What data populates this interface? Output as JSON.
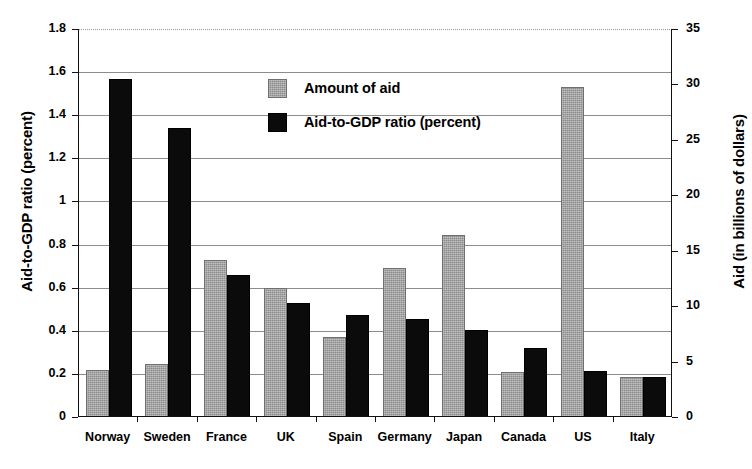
{
  "chart_data": {
    "type": "bar",
    "title": "",
    "subtitle": "",
    "xlabel": "",
    "ylabel": "Aid-to-GDP ratio (percent)",
    "ylabel_right": "Aid (in billions of dollars)",
    "categories": [
      "Norway",
      "Sweden",
      "France",
      "UK",
      "Spain",
      "Germany",
      "Japan",
      "Canada",
      "US",
      "Italy"
    ],
    "series": [
      {
        "name": "Amount of aid",
        "axis": "right",
        "unit": "billions of dollars",
        "color": "#8a8a8a",
        "values": [
          4.1,
          4.6,
          14.0,
          11.5,
          7.0,
          13.2,
          16.2,
          3.9,
          29.6,
          3.4
        ],
        "values_left_axis_equivalent": [
          0.21,
          0.235,
          0.72,
          0.59,
          0.36,
          0.68,
          0.835,
          0.2,
          1.52,
          0.175
        ]
      },
      {
        "name": "Aid-to-GDP ratio (percent)",
        "axis": "left",
        "unit": "percent",
        "color": "#0b0b0b",
        "values": [
          1.56,
          1.33,
          0.65,
          0.52,
          0.465,
          0.445,
          0.395,
          0.31,
          0.205,
          0.175
        ]
      }
    ],
    "ylim": [
      0,
      1.8
    ],
    "yticks": [
      "0",
      "0.2",
      "0.4",
      "0.6",
      "0.8",
      "1",
      "1.2",
      "1.4",
      "1.6",
      "1.8"
    ],
    "ytick_values": [
      0,
      0.2,
      0.4,
      0.6,
      0.8,
      1.0,
      1.2,
      1.4,
      1.6,
      1.8
    ],
    "ylim_right": [
      0,
      35
    ],
    "yticks_right": [
      "0",
      "5",
      "10",
      "15",
      "20",
      "25",
      "30",
      "35"
    ],
    "ytick_values_right": [
      0,
      5,
      10,
      15,
      20,
      25,
      30,
      35
    ],
    "grid": true,
    "legend_position": "upper-center",
    "legend": [
      "Amount of aid",
      "Aid-to-GDP ratio (percent)"
    ]
  }
}
